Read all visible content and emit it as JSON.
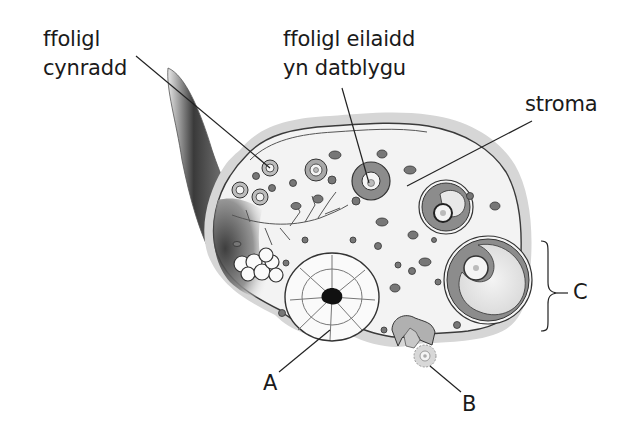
{
  "diagram": {
    "type": "anatomical-illustration",
    "labels": {
      "primary_follicle": [
        "ffoligl",
        "cynradd"
      ],
      "developing_secondary_follicle": [
        "ffoligl eilaidd",
        "yn datblygu"
      ],
      "stroma": "stroma",
      "A": "A",
      "B": "B",
      "C": "C"
    },
    "colors": {
      "outline": "#3a3a3a",
      "ring_fill": "#8c8c8c",
      "stroma_fill": "#f2f2f2",
      "capsule": "#cfcfcf",
      "label_text": "#1a1a1a"
    }
  }
}
